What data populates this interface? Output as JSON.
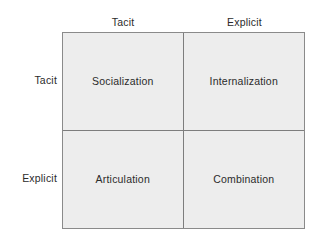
{
  "figure": {
    "columns": [
      {
        "id": "tacit",
        "label": "Tacit"
      },
      {
        "id": "explicit",
        "label": "Explicit"
      }
    ],
    "rows": [
      {
        "id": "tacit",
        "label": "Tacit"
      },
      {
        "id": "explicit",
        "label": "Explicit"
      }
    ],
    "quadrants": [
      {
        "id": "socialization",
        "label": "Socialization",
        "row": "tacit",
        "column": "tacit"
      },
      {
        "id": "internalization",
        "label": "Internalization",
        "row": "tacit",
        "column": "explicit"
      },
      {
        "id": "articulation",
        "label": "Articulation",
        "row": "explicit",
        "column": "tacit"
      },
      {
        "id": "combination",
        "label": "Combination",
        "row": "explicit",
        "column": "explicit"
      }
    ],
    "colors": {
      "cell_fill": "#ededed",
      "outer_border": "#8a8a8a",
      "inner_divider": "#7d7d7d",
      "text": "#2b2b2b",
      "background": "#ffffff"
    }
  }
}
